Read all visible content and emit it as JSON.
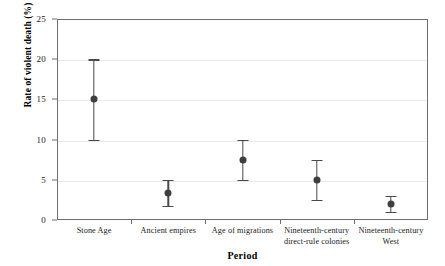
{
  "chart_data": {
    "type": "scatter",
    "title": "",
    "xlabel": "Period",
    "ylabel": "Rate of violent death (%)",
    "ylim": [
      0,
      25
    ],
    "y_ticks": [
      0,
      5,
      10,
      15,
      20,
      25
    ],
    "y_tick_labels": [
      "0",
      "5",
      "10",
      "15",
      "20",
      "25"
    ],
    "grid": "horizontal",
    "legend": "none",
    "categories": [
      "Stone Age",
      "Ancient empires",
      "Age of migrations",
      "Nineteenth-century\ndirect-rule colonies",
      "Nineteenth-century\nWest"
    ],
    "values": [
      15.0,
      3.4,
      7.5,
      5.0,
      2.0
    ],
    "error_low": [
      10.0,
      1.8,
      5.0,
      2.5,
      1.0
    ],
    "error_high": [
      20.0,
      5.0,
      10.0,
      7.5,
      3.0
    ],
    "series": [
      {
        "name": "Rate of violent death",
        "points": [
          {
            "category": "Stone Age",
            "value": 15.0,
            "low": 10.0,
            "high": 20.0
          },
          {
            "category": "Ancient empires",
            "value": 3.4,
            "low": 1.8,
            "high": 5.0
          },
          {
            "category": "Age of migrations",
            "value": 7.5,
            "low": 5.0,
            "high": 10.0
          },
          {
            "category": "Nineteenth-century direct-rule colonies",
            "value": 5.0,
            "low": 2.5,
            "high": 7.5
          },
          {
            "category": "Nineteenth-century West",
            "value": 2.0,
            "low": 1.0,
            "high": 3.0
          }
        ]
      }
    ],
    "colors": {
      "marker": "#3f3f3f",
      "errorbar": "#4a4a4a",
      "gridline": "#e9e9e9",
      "axis": "#6e6e6e",
      "text": "#1a1a1a",
      "background": "#ffffff"
    }
  }
}
